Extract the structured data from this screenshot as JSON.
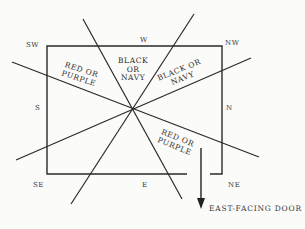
{
  "diagram": {
    "directions": {
      "sw": "SW",
      "w": "W",
      "nw": "NW",
      "s": "S",
      "n": "N",
      "se": "SE",
      "e": "E",
      "ne": "NE"
    },
    "zones": {
      "top_center": [
        "BLACK",
        "OR",
        "NAVY"
      ],
      "top_right": [
        "BLACK OR",
        "NAVY"
      ],
      "left_upper": [
        "RED OR",
        "PURPLE"
      ],
      "right_lower": [
        "RED OR",
        "PURPLE"
      ]
    },
    "door_label": "EAST-FACING DOOR",
    "colors": {
      "line": "#2a2a2a",
      "background": "#fbfbf9"
    }
  }
}
